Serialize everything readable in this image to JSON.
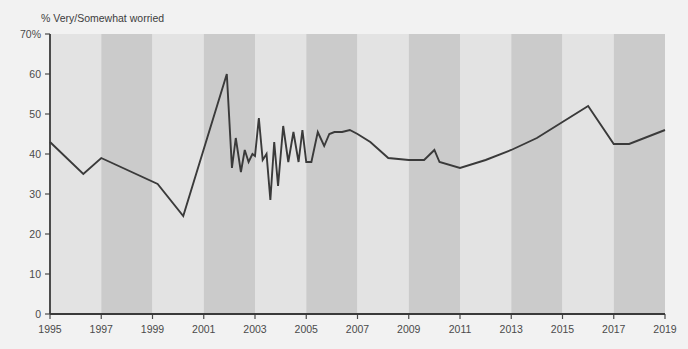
{
  "chart_data": {
    "type": "line",
    "title": "% Very/Somewhat worried",
    "xlabel": "",
    "ylabel": "",
    "ylim": [
      0,
      70
    ],
    "xlim": [
      1995,
      2019
    ],
    "grid": false,
    "legend": "none",
    "yticks": [
      0,
      10,
      20,
      30,
      40,
      50,
      60,
      70
    ],
    "ytick_labels": [
      "0",
      "10",
      "20",
      "30",
      "40",
      "50",
      "60",
      "70%"
    ],
    "xticks": [
      1995,
      1997,
      1999,
      2001,
      2003,
      2005,
      2007,
      2009,
      2011,
      2013,
      2015,
      2017,
      2019
    ],
    "xtick_labels": [
      "1995",
      "1997",
      "1999",
      "2001",
      "2003",
      "2005",
      "2007",
      "2009",
      "2011",
      "2013",
      "2015",
      "2017",
      "2019"
    ],
    "series": [
      {
        "name": "% Very/Somewhat worried",
        "color": "#3a3a3a",
        "x": [
          1995.0,
          1996.3,
          1997.0,
          1999.2,
          2000.2,
          2001.9,
          2002.1,
          2002.25,
          2002.45,
          2002.6,
          2002.75,
          2002.9,
          2003.0,
          2003.15,
          2003.3,
          2003.45,
          2003.6,
          2003.75,
          2003.9,
          2004.1,
          2004.3,
          2004.5,
          2004.7,
          2004.85,
          2005.0,
          2005.2,
          2005.45,
          2005.7,
          2005.9,
          2006.1,
          2006.4,
          2006.7,
          2007.0,
          2007.5,
          2008.2,
          2009.0,
          2009.6,
          2010.0,
          2010.2,
          2011.0,
          2012.0,
          2013.0,
          2014.0,
          2015.0,
          2016.0,
          2017.0,
          2017.6,
          2019.0
        ],
        "y": [
          43.0,
          35.0,
          39.0,
          32.5,
          24.5,
          60.0,
          36.5,
          44.0,
          35.5,
          41.0,
          38.0,
          40.0,
          39.5,
          49.0,
          38.5,
          40.0,
          28.5,
          43.0,
          32.0,
          47.0,
          38.0,
          45.5,
          38.0,
          46.0,
          38.0,
          38.0,
          45.5,
          42.0,
          45.0,
          45.5,
          45.5,
          46.0,
          45.0,
          43.0,
          39.0,
          38.5,
          38.5,
          41.0,
          38.0,
          36.5,
          38.5,
          41.0,
          44.0,
          48.0,
          52.0,
          42.5,
          42.5,
          46.0
        ]
      }
    ],
    "bands": [
      {
        "from": 1995.0,
        "to": 1997.0,
        "color": "#e3e3e3"
      },
      {
        "from": 1997.0,
        "to": 1999.0,
        "color": "#cbcbcb"
      },
      {
        "from": 1999.0,
        "to": 2001.0,
        "color": "#e3e3e3"
      },
      {
        "from": 2001.0,
        "to": 2003.0,
        "color": "#cbcbcb"
      },
      {
        "from": 2003.0,
        "to": 2005.0,
        "color": "#e3e3e3"
      },
      {
        "from": 2005.0,
        "to": 2007.0,
        "color": "#cbcbcb"
      },
      {
        "from": 2007.0,
        "to": 2009.0,
        "color": "#e3e3e3"
      },
      {
        "from": 2009.0,
        "to": 2011.0,
        "color": "#cbcbcb"
      },
      {
        "from": 2011.0,
        "to": 2013.0,
        "color": "#e3e3e3"
      },
      {
        "from": 2013.0,
        "to": 2015.0,
        "color": "#cbcbcb"
      },
      {
        "from": 2015.0,
        "to": 2017.0,
        "color": "#e3e3e3"
      },
      {
        "from": 2017.0,
        "to": 2019.0,
        "color": "#cbcbcb"
      }
    ],
    "colors": {
      "background": "#f2f2f2",
      "band_light": "#e3e3e3",
      "band_dark": "#cbcbcb",
      "line": "#3a3a3a",
      "axis": "#3a3a3a",
      "text": "#4a4a4a"
    }
  }
}
